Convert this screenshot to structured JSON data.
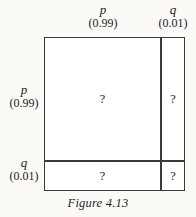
{
  "figure": {
    "caption": "Figure 4.13",
    "line_color": "#3a3a38",
    "cell_fill": "#ffffff",
    "page_background": "#fbfaf7"
  },
  "columns": [
    {
      "symbol": "p",
      "value": "(0.99)",
      "probability": 0.99
    },
    {
      "symbol": "q",
      "value": "(0.01)",
      "probability": 0.01
    }
  ],
  "rows": [
    {
      "symbol": "p",
      "value": "(0.99)",
      "probability": 0.99
    },
    {
      "symbol": "q",
      "value": "(0.01)",
      "probability": 0.01
    }
  ],
  "cells": [
    {
      "row": "p",
      "column": "p",
      "label": "?"
    },
    {
      "row": "p",
      "column": "q",
      "label": "?"
    },
    {
      "row": "q",
      "column": "p",
      "label": "?"
    },
    {
      "row": "q",
      "column": "q",
      "label": "?"
    }
  ]
}
